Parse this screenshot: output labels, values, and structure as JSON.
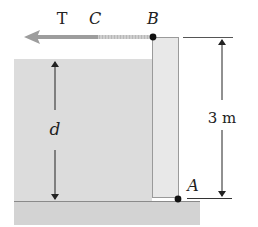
{
  "figure": {
    "type": "hinged gate holding back water",
    "labels": {
      "tension": "T",
      "rope_point": "C",
      "top_hinge": "B",
      "bottom_hinge": "A",
      "water_depth": "d",
      "gate_height": "3 m"
    }
  },
  "colors": {
    "water": "#dcdcdc",
    "gate": "#e6e6e6",
    "ground": "#d2d2d2",
    "arrow": "#9a9a9a",
    "rope": "#c4c4c4",
    "lines": "#333333"
  }
}
